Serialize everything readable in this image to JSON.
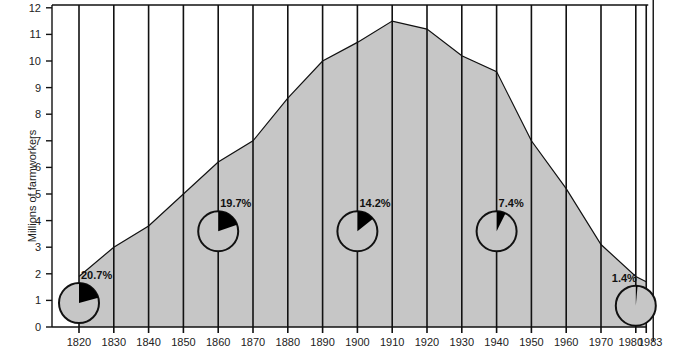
{
  "chart_data": {
    "type": "area",
    "title": "",
    "xlabel": "",
    "ylabel": "Millions of farmworkers",
    "ylim": [
      0,
      12
    ],
    "yticks": [
      0,
      1,
      2,
      3,
      4,
      5,
      6,
      7,
      8,
      9,
      10,
      11,
      12
    ],
    "xticks": [
      "1820",
      "1830",
      "1840",
      "1850",
      "1860",
      "1870",
      "1880",
      "1890",
      "1900",
      "1910",
      "1920",
      "1930",
      "1940",
      "1950",
      "1960",
      "1970",
      "1980",
      "1983"
    ],
    "grid": "vertical lines at each tick year",
    "x": [
      1820,
      1830,
      1840,
      1850,
      1860,
      1870,
      1880,
      1890,
      1900,
      1910,
      1920,
      1930,
      1940,
      1950,
      1960,
      1970,
      1980,
      1983
    ],
    "series": [
      {
        "name": "Millions of farmworkers",
        "values": [
          1.9,
          3.0,
          3.8,
          5.0,
          6.2,
          7.0,
          8.6,
          10.0,
          10.7,
          11.5,
          11.2,
          10.2,
          9.6,
          7.0,
          5.2,
          3.1,
          1.9,
          1.7
        ]
      }
    ],
    "annotations": [
      {
        "year": 1820,
        "label": "20.7%",
        "percent": 20.7,
        "center_value": 0.9
      },
      {
        "year": 1860,
        "label": "19.7%",
        "percent": 19.7,
        "center_value": 3.6
      },
      {
        "year": 1900,
        "label": "14.2%",
        "percent": 14.2,
        "center_value": 3.6
      },
      {
        "year": 1940,
        "label": "7.4%",
        "percent": 7.4,
        "center_value": 3.6
      },
      {
        "year": 1980,
        "label": "1.4%",
        "percent": 1.4,
        "center_value": 0.8
      }
    ],
    "colors": {
      "area_fill": "#c6c6c6",
      "pie_slice": "#000000",
      "pie_background": "#c6c6c6",
      "lines": "#111111"
    }
  }
}
